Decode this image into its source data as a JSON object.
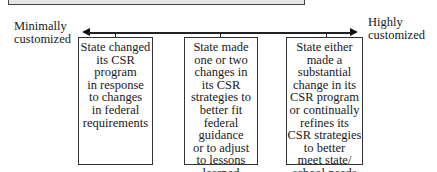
{
  "diagram": {
    "type": "continuum",
    "left_end_label": [
      "Minimally",
      "customized"
    ],
    "right_end_label": [
      "Highly",
      "customized"
    ],
    "boxes": [
      {
        "lines": [
          "State changed",
          "its CSR",
          "program",
          "in response",
          "to changes",
          "in federal",
          "requirements"
        ]
      },
      {
        "lines": [
          "State made",
          "one or two",
          "changes in",
          "its CSR",
          "strategies to",
          "better fit",
          "federal",
          "guidance",
          "or to adjust",
          "to lessons",
          "learned"
        ]
      },
      {
        "lines": [
          "State either",
          "made a",
          "substantial",
          "change in its",
          "CSR program",
          "or continually",
          "refines its",
          "CSR strategies",
          "to better",
          "meet state/",
          "school needs"
        ]
      }
    ]
  }
}
